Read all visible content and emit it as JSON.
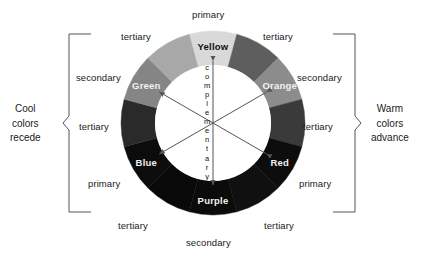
{
  "diagram": {
    "center_word": "complementary",
    "background": "#ffffff"
  },
  "wheel": {
    "center_x": 213,
    "center_y": 123,
    "outer_radius": 92,
    "inner_radius": 58,
    "segment_count": 12,
    "segments": [
      {
        "name": "Yellow",
        "label": "Yellow",
        "kind": "primary",
        "angle_deg": 0,
        "color": "#d9d9d9",
        "text_color": "dark"
      },
      {
        "name": "yellow-orange",
        "label": "",
        "kind": "tertiary",
        "angle_deg": 30,
        "color": "#5e5e5e",
        "text_color": "light"
      },
      {
        "name": "Orange",
        "label": "Orange",
        "kind": "secondary",
        "angle_deg": 60,
        "color": "#8c8c8c",
        "text_color": "light"
      },
      {
        "name": "red-orange",
        "label": "",
        "kind": "tertiary",
        "angle_deg": 90,
        "color": "#3a3a3a",
        "text_color": "light"
      },
      {
        "name": "Red",
        "label": "Red",
        "kind": "primary",
        "angle_deg": 120,
        "color": "#0d0d0d",
        "text_color": "light"
      },
      {
        "name": "red-purple",
        "label": "",
        "kind": "tertiary",
        "angle_deg": 150,
        "color": "#101010",
        "text_color": "light"
      },
      {
        "name": "Purple",
        "label": "Purple",
        "kind": "secondary",
        "angle_deg": 180,
        "color": "#0b0b0b",
        "text_color": "light"
      },
      {
        "name": "blue-purple",
        "label": "",
        "kind": "tertiary",
        "angle_deg": 210,
        "color": "#090909",
        "text_color": "light"
      },
      {
        "name": "Blue",
        "label": "Blue",
        "kind": "primary",
        "angle_deg": 240,
        "color": "#0c0c0c",
        "text_color": "light"
      },
      {
        "name": "blue-green",
        "label": "",
        "kind": "tertiary",
        "angle_deg": 270,
        "color": "#2a2a2a",
        "text_color": "light"
      },
      {
        "name": "Green",
        "label": "Green",
        "kind": "secondary",
        "angle_deg": 300,
        "color": "#858585",
        "text_color": "light"
      },
      {
        "name": "yellow-green",
        "label": "",
        "kind": "tertiary",
        "angle_deg": 330,
        "color": "#a8a8a8",
        "text_color": "light"
      }
    ]
  },
  "outer_labels": [
    {
      "name": "primary-top",
      "text": "primary",
      "x": 192,
      "y": 9
    },
    {
      "name": "tertiary-top-left",
      "text": "tertiary",
      "x": 121,
      "y": 31
    },
    {
      "name": "tertiary-top-right",
      "text": "tertiary",
      "x": 263,
      "y": 31
    },
    {
      "name": "secondary-left",
      "text": "secondary",
      "x": 76,
      "y": 72
    },
    {
      "name": "secondary-right",
      "text": "secondary",
      "x": 297,
      "y": 72
    },
    {
      "name": "tertiary-mid-left",
      "text": "tertiary",
      "x": 79,
      "y": 121
    },
    {
      "name": "tertiary-mid-right",
      "text": "tertiary",
      "x": 303,
      "y": 121
    },
    {
      "name": "primary-left",
      "text": "primary",
      "x": 88,
      "y": 178
    },
    {
      "name": "primary-right",
      "text": "primary",
      "x": 299,
      "y": 178
    },
    {
      "name": "tertiary-bot-left",
      "text": "tertiary",
      "x": 118,
      "y": 220
    },
    {
      "name": "tertiary-bot-right",
      "text": "tertiary",
      "x": 264,
      "y": 220
    },
    {
      "name": "secondary-bottom",
      "text": "secondary",
      "x": 186,
      "y": 237
    }
  ],
  "side_notes": {
    "left": {
      "name": "cool-colors-note",
      "lines": [
        "Cool",
        "colors",
        "recede"
      ],
      "x": 10,
      "y": 102
    },
    "right": {
      "name": "warm-colors-note",
      "lines": [
        "Warm",
        "colors",
        "advance"
      ],
      "x": 371,
      "y": 102
    }
  },
  "brackets": {
    "left": {
      "x_spine": 69,
      "x_tip": 63,
      "top": 34,
      "bottom": 212,
      "arm": 22
    },
    "right": {
      "x_spine": 355,
      "x_tip": 361,
      "top": 34,
      "bottom": 212,
      "arm": 22
    }
  },
  "arrows": [
    {
      "name": "complementary-arrow-vertical",
      "angle_deg": 0,
      "length": 62
    },
    {
      "name": "complementary-arrow-diagonal-1",
      "angle_deg": 60,
      "length": 62
    },
    {
      "name": "complementary-arrow-diagonal-2",
      "angle_deg": 120,
      "length": 62
    }
  ]
}
